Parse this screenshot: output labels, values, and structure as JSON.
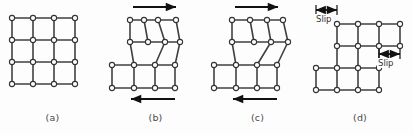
{
  "figure": {
    "type": "diagram",
    "background_color": "#fdfdfd",
    "line_color": "#404040",
    "node_fill_color": "#ffffff",
    "node_stroke_color": "#333333",
    "arrow_color": "#111111",
    "caption_color": "#4a4a4a"
  },
  "geometry": {
    "node_radius": 2.6,
    "line_width": 1.6,
    "cell": 21
  },
  "panels": [
    {
      "id": "a",
      "caption": "(a)",
      "left": 0,
      "width": 105,
      "description": "perfect undeformed square lattice",
      "nodes": [
        [
          12,
          18
        ],
        [
          33,
          18
        ],
        [
          54,
          18
        ],
        [
          75,
          18
        ],
        [
          12,
          40
        ],
        [
          33,
          40
        ],
        [
          54,
          40
        ],
        [
          75,
          40
        ],
        [
          12,
          62
        ],
        [
          33,
          62
        ],
        [
          54,
          62
        ],
        [
          75,
          62
        ],
        [
          12,
          84
        ],
        [
          33,
          84
        ],
        [
          54,
          84
        ],
        [
          75,
          84
        ]
      ],
      "edges": [
        [
          0,
          1
        ],
        [
          1,
          2
        ],
        [
          2,
          3
        ],
        [
          4,
          5
        ],
        [
          5,
          6
        ],
        [
          6,
          7
        ],
        [
          8,
          9
        ],
        [
          9,
          10
        ],
        [
          10,
          11
        ],
        [
          12,
          13
        ],
        [
          13,
          14
        ],
        [
          14,
          15
        ],
        [
          0,
          4
        ],
        [
          4,
          8
        ],
        [
          8,
          12
        ],
        [
          1,
          5
        ],
        [
          5,
          9
        ],
        [
          9,
          13
        ],
        [
          2,
          6
        ],
        [
          6,
          10
        ],
        [
          10,
          14
        ],
        [
          3,
          7
        ],
        [
          7,
          11
        ],
        [
          11,
          15
        ]
      ],
      "arrows": [],
      "slip_labels": []
    },
    {
      "id": "b",
      "caption": "(b)",
      "left": 103,
      "width": 105,
      "description": "edge dislocation formed at left of slip plane under shear",
      "nodes": [
        [
          27,
          20
        ],
        [
          41,
          20
        ],
        [
          55,
          20
        ],
        [
          73,
          20
        ],
        [
          27,
          42
        ],
        [
          45,
          42
        ],
        [
          62,
          42
        ],
        [
          77,
          42
        ],
        [
          9,
          65
        ],
        [
          31,
          65
        ],
        [
          52,
          65
        ],
        [
          72,
          65
        ],
        [
          9,
          88
        ],
        [
          31,
          88
        ],
        [
          52,
          88
        ],
        [
          72,
          88
        ]
      ],
      "edges": [
        [
          0,
          1
        ],
        [
          1,
          2
        ],
        [
          2,
          3
        ],
        [
          4,
          5
        ],
        [
          5,
          6
        ],
        [
          6,
          7
        ],
        [
          8,
          9
        ],
        [
          9,
          10
        ],
        [
          10,
          11
        ],
        [
          12,
          13
        ],
        [
          13,
          14
        ],
        [
          14,
          15
        ],
        [
          0,
          4
        ],
        [
          1,
          5
        ],
        [
          2,
          6
        ],
        [
          3,
          7
        ],
        [
          4,
          9
        ],
        [
          6,
          10
        ],
        [
          7,
          11
        ],
        [
          8,
          12
        ],
        [
          9,
          13
        ],
        [
          10,
          14
        ],
        [
          11,
          15
        ]
      ],
      "arrows": [
        {
          "name": "top-shear-arrow",
          "direction": "right",
          "x1": 30,
          "y1": 7,
          "x2": 73,
          "y2": 7
        },
        {
          "name": "bottom-shear-arrow",
          "direction": "left",
          "x1": 72,
          "y1": 99,
          "x2": 28,
          "y2": 99
        }
      ],
      "slip_labels": []
    },
    {
      "id": "c",
      "caption": "(c)",
      "left": 205,
      "width": 105,
      "description": "dislocation migrated toward the right under continued shear",
      "nodes": [
        [
          27,
          20
        ],
        [
          45,
          20
        ],
        [
          62,
          20
        ],
        [
          78,
          20
        ],
        [
          27,
          42
        ],
        [
          49,
          42
        ],
        [
          66,
          42
        ],
        [
          83,
          42
        ],
        [
          9,
          65
        ],
        [
          31,
          65
        ],
        [
          52,
          65
        ],
        [
          72,
          65
        ],
        [
          9,
          88
        ],
        [
          31,
          88
        ],
        [
          52,
          88
        ],
        [
          72,
          88
        ]
      ],
      "edges": [
        [
          0,
          1
        ],
        [
          1,
          2
        ],
        [
          2,
          3
        ],
        [
          4,
          5
        ],
        [
          5,
          6
        ],
        [
          6,
          7
        ],
        [
          8,
          9
        ],
        [
          9,
          10
        ],
        [
          10,
          11
        ],
        [
          12,
          13
        ],
        [
          13,
          14
        ],
        [
          14,
          15
        ],
        [
          0,
          4
        ],
        [
          1,
          5
        ],
        [
          2,
          6
        ],
        [
          3,
          7
        ],
        [
          4,
          9
        ],
        [
          6,
          10
        ],
        [
          7,
          11
        ],
        [
          8,
          12
        ],
        [
          9,
          13
        ],
        [
          10,
          14
        ],
        [
          11,
          15
        ]
      ],
      "arrows": [
        {
          "name": "top-shear-arrow",
          "direction": "right",
          "x1": 30,
          "y1": 7,
          "x2": 73,
          "y2": 7
        },
        {
          "name": "bottom-shear-arrow",
          "direction": "left",
          "x1": 72,
          "y1": 99,
          "x2": 28,
          "y2": 99
        }
      ],
      "slip_labels": []
    },
    {
      "id": "d",
      "caption": "(d)",
      "left": 307,
      "width": 106,
      "description": "dislocation has passed out of the crystal leaving a slip step",
      "nodes": [
        [
          30,
          24
        ],
        [
          51,
          24
        ],
        [
          72,
          24
        ],
        [
          93,
          24
        ],
        [
          30,
          46
        ],
        [
          51,
          46
        ],
        [
          72,
          46
        ],
        [
          93,
          46
        ],
        [
          9,
          68
        ],
        [
          30,
          68
        ],
        [
          51,
          68
        ],
        [
          72,
          68
        ],
        [
          9,
          90
        ],
        [
          30,
          90
        ],
        [
          51,
          90
        ],
        [
          72,
          90
        ]
      ],
      "edges": [
        [
          0,
          1
        ],
        [
          1,
          2
        ],
        [
          2,
          3
        ],
        [
          4,
          5
        ],
        [
          5,
          6
        ],
        [
          6,
          7
        ],
        [
          8,
          9
        ],
        [
          9,
          10
        ],
        [
          10,
          11
        ],
        [
          12,
          13
        ],
        [
          13,
          14
        ],
        [
          14,
          15
        ],
        [
          0,
          4
        ],
        [
          1,
          5
        ],
        [
          2,
          6
        ],
        [
          3,
          7
        ],
        [
          4,
          9
        ],
        [
          5,
          10
        ],
        [
          6,
          11
        ],
        [
          8,
          12
        ],
        [
          9,
          13
        ],
        [
          10,
          14
        ],
        [
          11,
          15
        ]
      ],
      "arrows": [
        {
          "name": "slip-dimension-arrow-top",
          "direction": "both",
          "x1": 9,
          "y1": 10,
          "x2": 30,
          "y2": 10
        },
        {
          "name": "slip-dimension-arrow-middle",
          "direction": "both",
          "x1": 72,
          "y1": 54,
          "x2": 93,
          "y2": 54
        }
      ],
      "slip_labels": [
        {
          "name": "slip-label-top",
          "text": "Slip",
          "x": 8,
          "y": 14
        },
        {
          "name": "slip-label-middle",
          "text": "Slip",
          "x": 70,
          "y": 58
        }
      ]
    }
  ]
}
